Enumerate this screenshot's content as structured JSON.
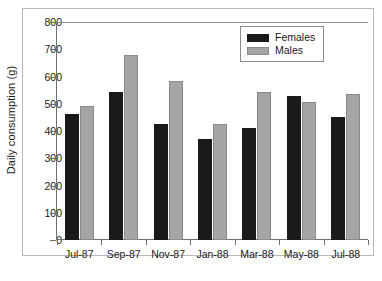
{
  "chart_data": {
    "type": "bar",
    "title": "",
    "xlabel": "",
    "ylabel": "Daily consumption (g)",
    "categories": [
      "Jul-87",
      "Sep-87",
      "Nov-87",
      "Jan-88",
      "Mar-88",
      "May-88",
      "Jul-88"
    ],
    "series": [
      {
        "name": "Females",
        "color": "#1a1a1a",
        "values": [
          463,
          545,
          425,
          370,
          412,
          527,
          452
        ]
      },
      {
        "name": "Males",
        "color": "#a5a5a5",
        "values": [
          490,
          680,
          582,
          425,
          545,
          505,
          535
        ]
      }
    ],
    "ylim": [
      0,
      800
    ],
    "yticks": [
      0,
      100,
      200,
      300,
      400,
      500,
      600,
      700,
      800
    ],
    "ytick_labels": [
      "0",
      "100",
      "200",
      "300",
      "400",
      "500",
      "600",
      "700",
      "800"
    ],
    "grid": false,
    "legend_position": "top-right",
    "legend_entries": [
      "Females",
      "Males"
    ]
  }
}
